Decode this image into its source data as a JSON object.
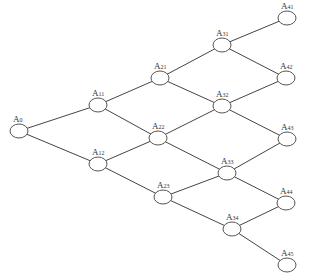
{
  "diagram": {
    "type": "lattice-tree",
    "nodes": [
      {
        "id": "A0",
        "base": "A",
        "sub": "0",
        "x": 19,
        "y": 131
      },
      {
        "id": "A11",
        "base": "A",
        "sub": "11",
        "x": 98,
        "y": 105
      },
      {
        "id": "A12",
        "base": "A",
        "sub": "12",
        "x": 98,
        "y": 164
      },
      {
        "id": "A21",
        "base": "A",
        "sub": "21",
        "x": 160,
        "y": 78
      },
      {
        "id": "A22",
        "base": "A",
        "sub": "22",
        "x": 158,
        "y": 138
      },
      {
        "id": "A23",
        "base": "A",
        "sub": "23",
        "x": 163,
        "y": 197
      },
      {
        "id": "A31",
        "base": "A",
        "sub": "31",
        "x": 222,
        "y": 45
      },
      {
        "id": "A32",
        "base": "A",
        "sub": "32",
        "x": 222,
        "y": 106
      },
      {
        "id": "A33",
        "base": "A",
        "sub": "33",
        "x": 227,
        "y": 173
      },
      {
        "id": "A34",
        "base": "A",
        "sub": "34",
        "x": 232,
        "y": 229
      },
      {
        "id": "A41",
        "base": "A",
        "sub": "41",
        "x": 287,
        "y": 18
      },
      {
        "id": "A42",
        "base": "A",
        "sub": "42",
        "x": 286,
        "y": 78
      },
      {
        "id": "A43",
        "base": "A",
        "sub": "43",
        "x": 287,
        "y": 139
      },
      {
        "id": "A44",
        "base": "A",
        "sub": "44",
        "x": 286,
        "y": 203
      },
      {
        "id": "A45",
        "base": "A",
        "sub": "45",
        "x": 287,
        "y": 265
      }
    ],
    "edges": [
      [
        "A0",
        "A11"
      ],
      [
        "A0",
        "A12"
      ],
      [
        "A11",
        "A21"
      ],
      [
        "A11",
        "A22"
      ],
      [
        "A12",
        "A22"
      ],
      [
        "A12",
        "A23"
      ],
      [
        "A21",
        "A31"
      ],
      [
        "A21",
        "A32"
      ],
      [
        "A22",
        "A32"
      ],
      [
        "A22",
        "A33"
      ],
      [
        "A23",
        "A33"
      ],
      [
        "A23",
        "A34"
      ],
      [
        "A31",
        "A41"
      ],
      [
        "A31",
        "A42"
      ],
      [
        "A32",
        "A42"
      ],
      [
        "A32",
        "A43"
      ],
      [
        "A33",
        "A43"
      ],
      [
        "A33",
        "A44"
      ],
      [
        "A34",
        "A44"
      ],
      [
        "A34",
        "A45"
      ]
    ],
    "node_rx": 9,
    "node_ry": 7
  }
}
